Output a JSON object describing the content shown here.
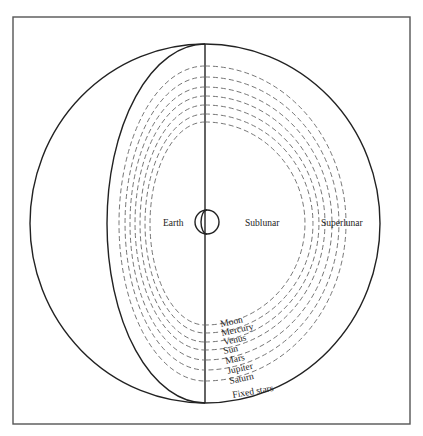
{
  "diagram": {
    "title": "",
    "labels": {
      "earth": "Earth",
      "sublunar": "Sublunar",
      "superlunar": "Superlunar",
      "fixed_stars": "Fixed stars"
    },
    "spheres": [
      {
        "name": "Moon"
      },
      {
        "name": "Mercury"
      },
      {
        "name": "Venus"
      },
      {
        "name": "Sun"
      },
      {
        "name": "Mars"
      },
      {
        "name": "Jupiter"
      },
      {
        "name": "Saturn"
      }
    ],
    "colors": {
      "line": "#222222",
      "dash": "#666666",
      "frame": "#555555",
      "background": "#ffffff"
    }
  }
}
